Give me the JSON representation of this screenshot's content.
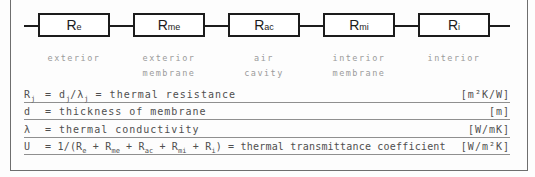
{
  "diagram": {
    "nodes": [
      {
        "id": "re",
        "box": [
          {
            "text": "R"
          },
          {
            "sub": "e"
          }
        ],
        "label_lines": [
          "exterior"
        ]
      },
      {
        "id": "rme",
        "box": [
          {
            "text": "R"
          },
          {
            "sub": "me"
          }
        ],
        "label_lines": [
          "exterior",
          "membrane"
        ]
      },
      {
        "id": "rac",
        "box": [
          {
            "text": "R"
          },
          {
            "sub": "ac"
          }
        ],
        "label_lines": [
          "air",
          "cavity"
        ]
      },
      {
        "id": "rmi",
        "box": [
          {
            "text": "R"
          },
          {
            "sub": "mi"
          }
        ],
        "label_lines": [
          "interior",
          "membrane"
        ]
      },
      {
        "id": "ri",
        "box": [
          {
            "text": "R"
          },
          {
            "sub": "i"
          }
        ],
        "label_lines": [
          "interior"
        ]
      }
    ]
  },
  "legend": {
    "rows": [
      {
        "id": "thermal-resistance",
        "symbol": [
          {
            "text": "R"
          },
          {
            "sub": "j"
          }
        ],
        "definition": [
          {
            "text": "= d"
          },
          {
            "sub": "j"
          },
          {
            "text": "/λ"
          },
          {
            "sub": "j"
          },
          {
            "text": " = thermal resistance"
          }
        ],
        "unit": "[m²K/W]"
      },
      {
        "id": "thickness",
        "symbol": [
          {
            "text": "d"
          }
        ],
        "definition": [
          {
            "text": "= thickness of membrane"
          }
        ],
        "unit": "[m]"
      },
      {
        "id": "conductivity",
        "symbol": [
          {
            "text": "λ"
          }
        ],
        "definition": [
          {
            "text": "= thermal conductivity"
          }
        ],
        "unit": "[W/mK]"
      },
      {
        "id": "transmittance",
        "symbol": [
          {
            "text": "U"
          }
        ],
        "definition": [
          {
            "text": "= 1/(R"
          },
          {
            "sub": "e"
          },
          {
            "text": " + R"
          },
          {
            "sub": "me"
          },
          {
            "text": " + R"
          },
          {
            "sub": "ac"
          },
          {
            "text": " + R"
          },
          {
            "sub": "mi"
          },
          {
            "text": " + R"
          },
          {
            "sub": "i"
          },
          {
            "text": ") = thermal transmittance coefficient"
          }
        ],
        "unit": "[W/m²K]"
      }
    ]
  },
  "colors": {
    "ink": "#1c1c1c",
    "muted": "#9b9b9b",
    "legend": "#4f4f4f",
    "rule": "#8f8f8f",
    "frame": "#6e6e6e",
    "paper": "#fdfdfd",
    "box_fill": "#ffffff"
  }
}
